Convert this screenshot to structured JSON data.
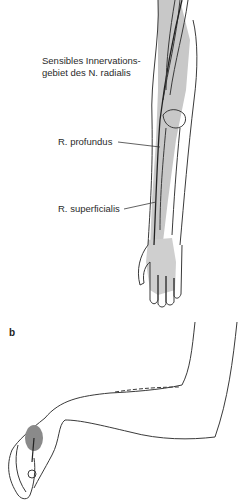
{
  "figure": {
    "panel_a": {
      "labels": {
        "innervation_line1": "Sensibles Innervations-",
        "innervation_line2": "gebiet des N. radialis",
        "profundus": "R. profundus",
        "superficialis": "R. superficialis"
      }
    },
    "panel_b": {
      "letter": "b"
    },
    "colors": {
      "shading": "#c8c8c8",
      "outline": "#3a3a3a",
      "dark_spot": "#8a8a8a"
    }
  }
}
